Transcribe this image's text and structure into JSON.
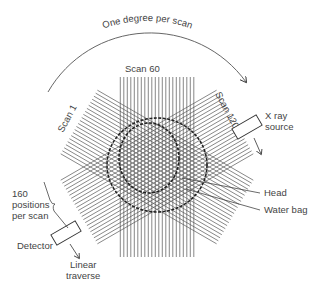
{
  "diagram": {
    "arc_label": "One degree per scan",
    "scan_labels": {
      "first": "Scan 1",
      "middle": "Scan 60",
      "last": "Scan 120"
    },
    "source_label": [
      "X ray",
      "source"
    ],
    "detector_label": "Detector",
    "positions_label": [
      "160",
      "positions",
      "per scan"
    ],
    "traverse_label": [
      "Linear",
      "traverse"
    ],
    "head_label": "Head",
    "water_bag_label": "Water bag",
    "geometry": {
      "center": [
        157,
        167
      ],
      "lines_per_band": 22,
      "band_spacing": 3.5,
      "band_half_length": 90,
      "band_angles_deg": [
        0,
        60,
        -60
      ]
    },
    "colors": {
      "line": "#555555",
      "text": "#444444",
      "outline": "#222222"
    }
  }
}
